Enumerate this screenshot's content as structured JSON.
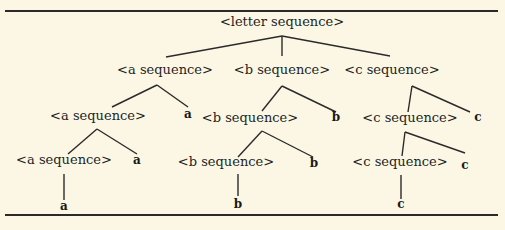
{
  "figure": {
    "type": "parse-tree",
    "root": {
      "id": "root",
      "label": "<letter sequence>",
      "children": [
        {
          "id": "a1",
          "label": "<a sequence>",
          "children": [
            {
              "id": "a2",
              "label": "<a sequence>",
              "children": [
                {
                  "id": "a3",
                  "label": "<a sequence>",
                  "children": [
                    {
                      "id": "a3t",
                      "label": "a",
                      "terminal": true
                    }
                  ]
                },
                {
                  "id": "a2t",
                  "label": "a",
                  "terminal": true
                }
              ]
            },
            {
              "id": "a1t",
              "label": "a",
              "terminal": true
            }
          ]
        },
        {
          "id": "b1",
          "label": "<b sequence>",
          "children": [
            {
              "id": "b2",
              "label": "<b sequence>",
              "children": [
                {
                  "id": "b3",
                  "label": "<b sequence>",
                  "children": [
                    {
                      "id": "b3t",
                      "label": "b",
                      "terminal": true
                    }
                  ]
                },
                {
                  "id": "b2t",
                  "label": "b",
                  "terminal": true
                }
              ]
            },
            {
              "id": "b1t",
              "label": "b",
              "terminal": true
            }
          ]
        },
        {
          "id": "c1",
          "label": "<c sequence>",
          "children": [
            {
              "id": "c2",
              "label": "<c sequence>",
              "children": [
                {
                  "id": "c3",
                  "label": "<c sequence>",
                  "children": [
                    {
                      "id": "c3t",
                      "label": "c",
                      "terminal": true
                    }
                  ]
                },
                {
                  "id": "c2t",
                  "label": "c",
                  "terminal": true
                }
              ]
            },
            {
              "id": "c1t",
              "label": "c",
              "terminal": true
            }
          ]
        }
      ]
    },
    "colors": {
      "background": "#fbf7e4",
      "ink": "#1f1f1f"
    }
  }
}
